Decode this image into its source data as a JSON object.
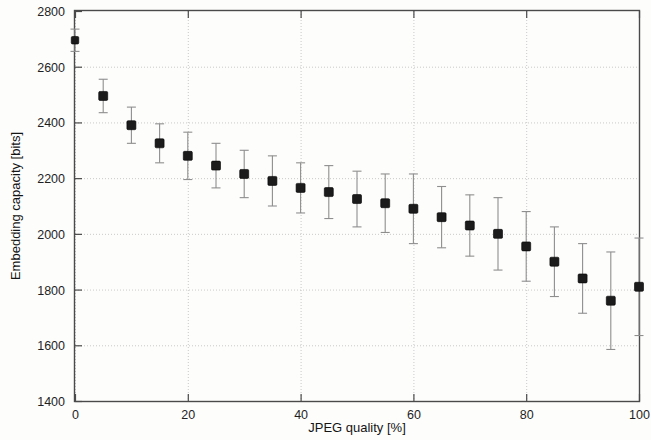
{
  "chart_data": {
    "type": "scatter",
    "title": "",
    "xlabel": "JPEG quality [%]",
    "ylabel": "Embedding capacity [bits]",
    "xlim": [
      0,
      100
    ],
    "ylim": [
      1400,
      2800
    ],
    "xticks": [
      0,
      20,
      40,
      60,
      80,
      100
    ],
    "xtick_labels": [
      "0",
      "20",
      "40",
      "60",
      "80",
      "100"
    ],
    "yticks": [
      1400,
      1600,
      1800,
      2000,
      2200,
      2400,
      2600,
      2800
    ],
    "ytick_labels": [
      "1400",
      "1600",
      "1800",
      "2000",
      "2200",
      "2400",
      "2600",
      "2800"
    ],
    "grid": true,
    "legend": null,
    "marker": "square",
    "marker_color": "#1b1b1b",
    "errorbar_color": "#8e8e8e",
    "x": [
      0,
      5,
      10,
      15,
      20,
      25,
      30,
      35,
      40,
      45,
      50,
      55,
      60,
      65,
      70,
      75,
      80,
      85,
      90,
      95,
      100
    ],
    "values": [
      2695,
      2495,
      2390,
      2325,
      2280,
      2245,
      2215,
      2190,
      2165,
      2150,
      2125,
      2110,
      2090,
      2060,
      2030,
      2000,
      1955,
      1900,
      1840,
      1760,
      1810
    ],
    "yerr": [
      40,
      60,
      65,
      70,
      85,
      80,
      85,
      90,
      90,
      95,
      100,
      105,
      125,
      110,
      110,
      130,
      125,
      125,
      125,
      175,
      175
    ],
    "series": [
      {
        "name": "Embedding capacity",
        "points": [
          {
            "x": 0,
            "y": 2695,
            "err": 40
          },
          {
            "x": 5,
            "y": 2495,
            "err": 60
          },
          {
            "x": 10,
            "y": 2390,
            "err": 65
          },
          {
            "x": 15,
            "y": 2325,
            "err": 70
          },
          {
            "x": 20,
            "y": 2280,
            "err": 85
          },
          {
            "x": 25,
            "y": 2245,
            "err": 80
          },
          {
            "x": 30,
            "y": 2215,
            "err": 85
          },
          {
            "x": 35,
            "y": 2190,
            "err": 90
          },
          {
            "x": 40,
            "y": 2165,
            "err": 90
          },
          {
            "x": 45,
            "y": 2150,
            "err": 95
          },
          {
            "x": 50,
            "y": 2125,
            "err": 100
          },
          {
            "x": 55,
            "y": 2110,
            "err": 105
          },
          {
            "x": 60,
            "y": 2090,
            "err": 125
          },
          {
            "x": 65,
            "y": 2060,
            "err": 110
          },
          {
            "x": 70,
            "y": 2030,
            "err": 110
          },
          {
            "x": 75,
            "y": 2000,
            "err": 130
          },
          {
            "x": 80,
            "y": 1955,
            "err": 125
          },
          {
            "x": 85,
            "y": 1900,
            "err": 125
          },
          {
            "x": 90,
            "y": 1840,
            "err": 125
          },
          {
            "x": 95,
            "y": 1760,
            "err": 175
          },
          {
            "x": 100,
            "y": 1810,
            "err": 175
          }
        ]
      }
    ]
  }
}
